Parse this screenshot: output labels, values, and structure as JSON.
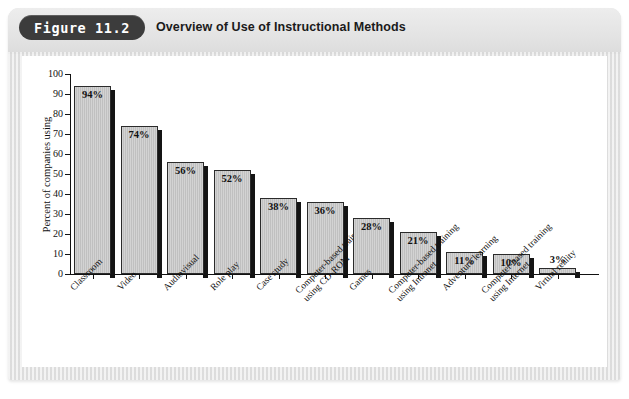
{
  "figure": {
    "badge": "Figure 11.2",
    "title": "Overview of Use of Instructional Methods"
  },
  "chart_data": {
    "type": "bar",
    "title": "Overview of Use of Instructional Methods",
    "xlabel": "",
    "ylabel": "Percent of companies using",
    "ylim": [
      0,
      100
    ],
    "ytick_step": 10,
    "yticks": [
      "0",
      "10",
      "20",
      "30",
      "40",
      "50",
      "60",
      "70",
      "80",
      "90",
      "100"
    ],
    "grid": false,
    "legend": false,
    "value_label_suffix": "%",
    "categories": [
      "Classroom",
      "Video",
      "Audiovisual",
      "Role play",
      "Case study",
      "Computer-based training using CD-ROM",
      "Games",
      "Computer-based training using Intranet",
      "Adventure learning",
      "Computer-based training using Internet",
      "Virtual reality"
    ],
    "category_lines": [
      [
        "Classroom"
      ],
      [
        "Video"
      ],
      [
        "Audiovisual"
      ],
      [
        "Role play"
      ],
      [
        "Case study"
      ],
      [
        "Computer-based training",
        "using CD-ROM"
      ],
      [
        "Games"
      ],
      [
        "Computer-based training",
        "using Intranet"
      ],
      [
        "Adventure learning"
      ],
      [
        "Computer-based training",
        "using Internet"
      ],
      [
        "Virtual reality"
      ]
    ],
    "values": [
      94,
      74,
      56,
      52,
      38,
      36,
      28,
      21,
      11,
      10,
      3
    ],
    "value_labels": [
      "94%",
      "74%",
      "56%",
      "52%",
      "38%",
      "36%",
      "28%",
      "21%",
      "11%",
      "10%",
      "3%"
    ],
    "colors": {
      "bar_fill": "#c2c2c2",
      "bar_outline": "#2b2b2b",
      "bar_shadow": "#141414",
      "panel_background": "#ffffff",
      "frame_background": "#e4e4e4",
      "badge_background": "#3c3c3c",
      "badge_text": "#ffffff",
      "axis": "#111111"
    }
  }
}
